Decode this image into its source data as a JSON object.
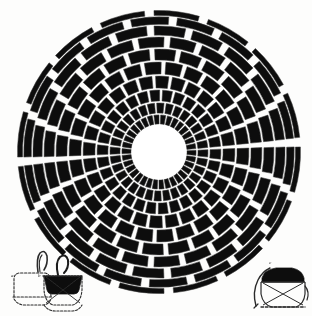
{
  "figure": {
    "caption_labels": [
      "a",
      "b",
      "c"
    ],
    "colors": {
      "background": "#fdfdfc",
      "block_fill": "#0d0d0d",
      "joint": "#ffffff",
      "outline": "#3a3a3a",
      "line": "#2b2b2b",
      "oculus": "#ffffff"
    }
  },
  "dome": {
    "name": "radial-dome-plan",
    "center": {
      "x": 159,
      "y": 152
    },
    "outer_radius": 142,
    "oculus_radius": 27,
    "ring_count": 10,
    "rotation_deg": -4,
    "rings": [
      {
        "index": 1,
        "inner_r": 27,
        "outer_r": 38,
        "sectors": 34,
        "gap_deg": 2.6
      },
      {
        "index": 2,
        "inner_r": 38,
        "outer_r": 50,
        "sectors": 32,
        "gap_deg": 2.6
      },
      {
        "index": 3,
        "inner_r": 50,
        "outer_r": 63,
        "sectors": 30,
        "gap_deg": 2.7
      },
      {
        "index": 4,
        "inner_r": 63,
        "outer_r": 77,
        "sectors": 28,
        "gap_deg": 2.8
      },
      {
        "index": 5,
        "inner_r": 77,
        "outer_r": 91,
        "sectors": 26,
        "gap_deg": 3.0
      },
      {
        "index": 6,
        "inner_r": 91,
        "outer_r": 104,
        "sectors": 24,
        "gap_deg": 3.1
      },
      {
        "index": 7,
        "inner_r": 104,
        "outer_r": 116,
        "sectors": 22,
        "gap_deg": 3.3
      },
      {
        "index": 8,
        "inner_r": 116,
        "outer_r": 127,
        "sectors": 20,
        "gap_deg": 3.5
      },
      {
        "index": 9,
        "inner_r": 127,
        "outer_r": 136,
        "sectors": 18,
        "gap_deg": 3.7
      },
      {
        "index": 10,
        "inner_r": 136,
        "outer_r": 142,
        "sectors": 16,
        "gap_deg": 3.9
      }
    ]
  },
  "details": [
    {
      "id": "detail-a",
      "label": "a",
      "label_pos": {
        "x": 11,
        "y": 277
      },
      "box": {
        "x": 6,
        "y": 252,
        "w": 50,
        "h": 60
      },
      "description": "vessel section outline, dashed profile with curved handle"
    },
    {
      "id": "detail-b",
      "label": "b",
      "label_pos": {
        "x": 38,
        "y": 277
      },
      "box": {
        "x": 34,
        "y": 252,
        "w": 54,
        "h": 62
      },
      "description": "vessel with filled triangular rim band and crossed interior lines"
    },
    {
      "id": "detail-c",
      "label": "c",
      "label_pos": {
        "x": 269,
        "y": 264
      },
      "box": {
        "x": 246,
        "y": 258,
        "w": 62,
        "h": 54
      },
      "description": "vessel section, hatched upper band with crossed interior lines"
    }
  ]
}
